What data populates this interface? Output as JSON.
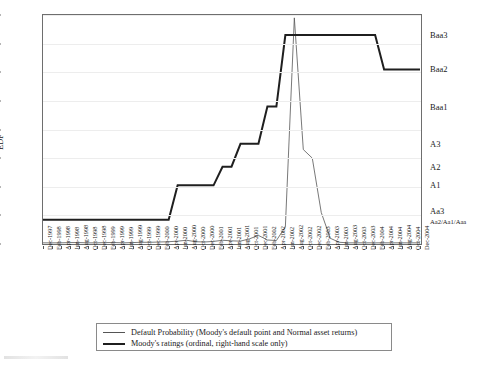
{
  "chart_data": {
    "type": "line",
    "title": "",
    "xlabel": "",
    "ylabel": "EDF",
    "ylim": [
      0,
      0.8
    ],
    "y_tick_labels": [
      "0%",
      "10%",
      "20%",
      "30%",
      "40%",
      "50%",
      "60%",
      "70%",
      "80%"
    ],
    "y_tick_values": [
      0,
      0.1,
      0.2,
      0.3,
      0.4,
      0.5,
      0.6,
      0.7,
      0.8
    ],
    "grid": true,
    "legend_position": "below-axes",
    "right_axis": {
      "label": "",
      "ticks": [
        {
          "label": "Baa3",
          "value": 0.73
        },
        {
          "label": "Baa2",
          "value": 0.61
        },
        {
          "label": "Baa1",
          "value": 0.48
        },
        {
          "label": "A3",
          "value": 0.35
        },
        {
          "label": "A2",
          "value": 0.27
        },
        {
          "label": "A1",
          "value": 0.205
        },
        {
          "label": "Aa3",
          "value": 0.115
        },
        {
          "label": "Aa2/Aa1/Aaa",
          "value": 0.082
        }
      ]
    },
    "categories": [
      "Dec-1997",
      "Feb-1998",
      "Apr-1998",
      "Jun-1998",
      "Aug-1998",
      "Oct-1998",
      "Dec-1998",
      "Feb-1999",
      "Apr-1999",
      "Jun-1999",
      "Aug-1999",
      "Oct-1999",
      "Dec-1999",
      "Feb-2000",
      "Apr-2000",
      "Jun-2000",
      "Aug-2000",
      "Oct-2000",
      "Dec-2000",
      "Feb-2001",
      "Apr-2001",
      "Jun-2001",
      "Aug-2001",
      "Oct-2001",
      "Dec-2001",
      "Feb-2002",
      "Apr-2002",
      "Jun-2002",
      "Aug-2002",
      "Oct-2002",
      "Dec-2002",
      "Feb-2003",
      "Apr-2003",
      "Jun-2003",
      "Aug-2003",
      "Oct-2003",
      "Dec-2003",
      "Feb-2004",
      "Apr-2004",
      "Jun-2004",
      "Aug-2004",
      "Oct-2004",
      "Dec-2004"
    ],
    "series": [
      {
        "name": "Default Probability (Moody's default point and Normal asset returns)",
        "color": "#555555",
        "width": 0.8,
        "values": [
          0.004,
          0.004,
          0.004,
          0.005,
          0.005,
          0.004,
          0.004,
          0.005,
          0.005,
          0.004,
          0.005,
          0.006,
          0.006,
          0.007,
          0.008,
          0.01,
          0.013,
          0.008,
          0.007,
          0.009,
          0.013,
          0.011,
          0.01,
          0.018,
          0.03,
          0.014,
          0.012,
          0.06,
          0.79,
          0.33,
          0.3,
          0.11,
          0.02,
          0.006,
          0.004,
          0.004,
          0.004,
          0.004,
          0.004,
          0.004,
          0.004,
          0.004,
          0.004
        ]
      },
      {
        "name": "Moody's ratings (ordinal, right-hand scale only)",
        "color": "#1f1f1f",
        "width": 2.0,
        "values": [
          0.085,
          0.085,
          0.085,
          0.085,
          0.085,
          0.085,
          0.085,
          0.085,
          0.085,
          0.085,
          0.085,
          0.085,
          0.085,
          0.085,
          0.085,
          0.205,
          0.205,
          0.205,
          0.205,
          0.205,
          0.27,
          0.27,
          0.35,
          0.35,
          0.35,
          0.48,
          0.48,
          0.73,
          0.73,
          0.73,
          0.73,
          0.73,
          0.73,
          0.73,
          0.73,
          0.73,
          0.73,
          0.73,
          0.61,
          0.61,
          0.61,
          0.61,
          0.61
        ]
      }
    ]
  },
  "legend": {
    "entries": [
      {
        "label": "Default Probability (Moody's default point and Normal asset returns)",
        "color": "#555555",
        "thickness": "1.2px"
      },
      {
        "label": "Moody's ratings (ordinal, right-hand scale only)",
        "color": "#1f1f1f",
        "thickness": "2.4px"
      }
    ]
  }
}
